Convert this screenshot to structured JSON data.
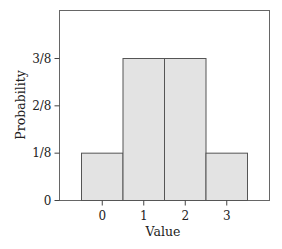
{
  "chart_data": {
    "type": "bar",
    "title": "",
    "xlabel": "Value",
    "ylabel": "Probability",
    "categories": [
      "0",
      "1",
      "2",
      "3"
    ],
    "values": [
      0.125,
      0.375,
      0.375,
      0.125
    ],
    "value_labels": [
      "1/8",
      "3/8",
      "3/8",
      "1/8"
    ],
    "yticks": [
      {
        "value": 0,
        "label": "0"
      },
      {
        "value": 0.125,
        "label": "1/8"
      },
      {
        "value": 0.25,
        "label": "2/8"
      },
      {
        "value": 0.375,
        "label": "3/8"
      }
    ],
    "ylim": [
      0,
      0.5
    ],
    "grid": false,
    "legend": null,
    "bar_width": 1.0,
    "colors": {
      "bar_fill": "#e3e3e3",
      "bar_stroke": "#555555",
      "frame": "#666666"
    }
  }
}
